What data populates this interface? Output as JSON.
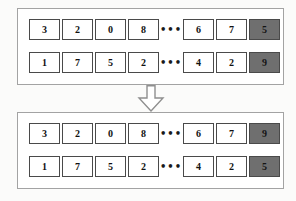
{
  "colors": {
    "page_bg": "#fbfbfa",
    "panel_bg": "#ffffff",
    "panel_border": "#a3a3a3",
    "cell_bg": "#ffffff",
    "cell_border": "#4a4a4a",
    "cell_text": "#111111",
    "highlight_fill": "#6f6f6f",
    "highlight_text": "#141414",
    "arrow_stroke": "#8f8f8f",
    "arrow_fill": "#ffffff"
  },
  "icons": {
    "arrow": "down-block-arrow"
  },
  "panels": [
    {
      "id": "before",
      "rows": [
        {
          "cells_left": [
            "3",
            "2",
            "0",
            "8"
          ],
          "dots": "•••",
          "cells_right": [
            "6",
            "7"
          ],
          "highlight": "5"
        },
        {
          "cells_left": [
            "1",
            "7",
            "5",
            "2"
          ],
          "dots": "•••",
          "cells_right": [
            "4",
            "2"
          ],
          "highlight": "9"
        }
      ]
    },
    {
      "id": "after",
      "rows": [
        {
          "cells_left": [
            "3",
            "2",
            "0",
            "8"
          ],
          "dots": "•••",
          "cells_right": [
            "6",
            "7"
          ],
          "highlight": "9"
        },
        {
          "cells_left": [
            "1",
            "7",
            "5",
            "2"
          ],
          "dots": "•••",
          "cells_right": [
            "4",
            "2"
          ],
          "highlight": "5"
        }
      ]
    }
  ]
}
